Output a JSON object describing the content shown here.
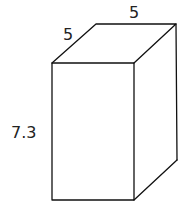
{
  "diagram": {
    "type": "rectangular-prism",
    "labels": {
      "depth": "5",
      "width": "5",
      "height": "7.3"
    },
    "line_color": "#111111",
    "text_color": "#222222",
    "background": "#ffffff"
  }
}
